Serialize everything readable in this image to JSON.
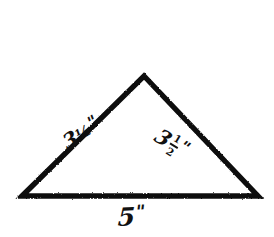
{
  "figure": {
    "kind": "geometry-diagram",
    "shape": "isosceles-triangle",
    "style": "hand-drawn",
    "background_color": "#ffffff",
    "stroke_color": "#111111",
    "stroke_width_px": 5,
    "canvas": {
      "width": 274,
      "height": 237
    }
  },
  "geometry": {
    "vertices": {
      "apex": {
        "x": 144,
        "y": 76
      },
      "bottom_left": {
        "x": 22,
        "y": 196
      },
      "bottom_right": {
        "x": 258,
        "y": 196
      }
    },
    "path": "M 22 196 L 144 76 L 258 196 Z"
  },
  "labels": {
    "left_side": {
      "text": "3½\"",
      "whole": "3",
      "fraction": "½",
      "unit": "\"",
      "fraction_style": "inline",
      "rotation_deg": -31
    },
    "right_side": {
      "text": "3½\"",
      "whole": "3",
      "numerator": "1",
      "denominator": "2",
      "unit": "\"",
      "fraction_style": "stacked",
      "rotation_deg": 31
    },
    "base": {
      "text": "5\"",
      "whole": "5",
      "unit": "\"",
      "rotation_deg": -3
    }
  }
}
